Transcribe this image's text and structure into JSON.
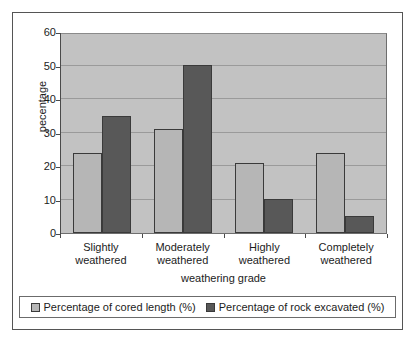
{
  "chart_data": {
    "type": "bar",
    "title": "",
    "xlabel": "weathering grade",
    "ylabel": "pecentage",
    "categories": [
      "Slightly weathered",
      "Moderately weathered",
      "Highly weathered",
      "Completely weathered"
    ],
    "category_lines": [
      [
        "Slightly",
        "weathered"
      ],
      [
        "Moderately",
        "weathered"
      ],
      [
        "Highly",
        "weathered"
      ],
      [
        "Completely",
        "weathered"
      ]
    ],
    "series": [
      {
        "name": "Percentage of cored length (%)",
        "color": "#b6b6b6",
        "values": [
          24,
          31,
          21,
          24
        ]
      },
      {
        "name": "Percentage of rock excavated (%)",
        "color": "#585858",
        "values": [
          35,
          50,
          10,
          5
        ]
      }
    ],
    "ylim": [
      0,
      60
    ],
    "yticks": [
      0,
      10,
      20,
      30,
      40,
      50,
      60
    ],
    "ytick_labels": [
      "0",
      "10",
      "20",
      "30",
      "40",
      "50",
      "60"
    ],
    "grid": true,
    "grid_axis": "y",
    "legend_position": "bottom",
    "plot_background": "#c2c2c2",
    "figure_background": "#ffffff"
  }
}
